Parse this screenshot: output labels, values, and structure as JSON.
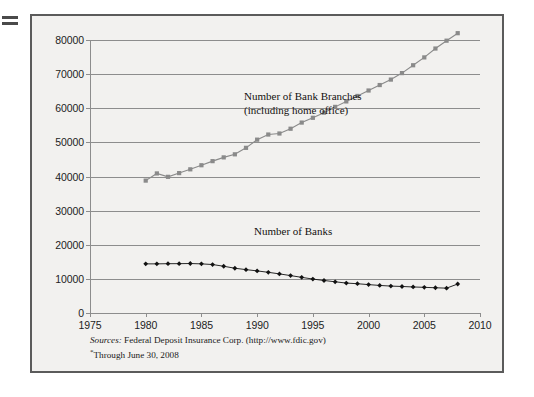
{
  "figure": {
    "background_color": "#f2f1ef",
    "frame_color": "#5b5b5b",
    "edge_mark_name": "page-edge-mark"
  },
  "annotations": {
    "branches_line1": "Number of Bank Branches",
    "branches_line2": "(including home office)",
    "banks": "Number of Banks"
  },
  "source_note": {
    "lead": "Sources:",
    "text": "Federal Deposit Insurance Corp. (http://www.fdic.gov)",
    "footnote": "Through June 30, 2008"
  },
  "chart_data": {
    "type": "line",
    "title": "",
    "xlabel": "",
    "ylabel": "",
    "xlim": [
      1975,
      2010
    ],
    "ylim": [
      0,
      80000
    ],
    "grid": true,
    "legend_position": "inline-annotation",
    "xticks": [
      1975,
      1980,
      1985,
      1990,
      1995,
      2000,
      2005,
      2010
    ],
    "yticks": [
      0,
      10000,
      20000,
      30000,
      40000,
      50000,
      60000,
      70000,
      80000
    ],
    "series": [
      {
        "name": "Number of Bank Branches (including home office)",
        "color": "#8a8a8a",
        "marker": "square",
        "x": [
          1980,
          1981,
          1982,
          1983,
          1984,
          1985,
          1986,
          1987,
          1988,
          1989,
          1990,
          1991,
          1992,
          1993,
          1994,
          1995,
          1996,
          1997,
          1998,
          1999,
          2000,
          2001,
          2002,
          2003,
          2004,
          2005,
          2006,
          2007,
          2008
        ],
        "values": [
          38800,
          40900,
          39900,
          41000,
          42100,
          43300,
          44500,
          45600,
          46500,
          48400,
          50800,
          52300,
          52600,
          54000,
          55800,
          57200,
          58700,
          60400,
          62000,
          63600,
          65200,
          66800,
          68400,
          70300,
          72600,
          74900,
          77500,
          79800,
          82000
        ]
      },
      {
        "name": "Number of Banks",
        "color": "#111111",
        "marker": "diamond",
        "x": [
          1980,
          1981,
          1982,
          1983,
          1984,
          1985,
          1986,
          1987,
          1988,
          1989,
          1990,
          1991,
          1992,
          1993,
          1994,
          1995,
          1996,
          1997,
          1998,
          1999,
          2000,
          2001,
          2002,
          2003,
          2004,
          2005,
          2006,
          2007,
          2008
        ],
        "values": [
          14400,
          14400,
          14450,
          14460,
          14500,
          14400,
          14200,
          13700,
          13120,
          12710,
          12340,
          11920,
          11460,
          10960,
          10450,
          9940,
          9530,
          9140,
          8770,
          8580,
          8320,
          8080,
          7890,
          7770,
          7630,
          7520,
          7400,
          7280,
          8500
        ]
      }
    ]
  }
}
